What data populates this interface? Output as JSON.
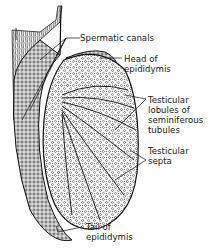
{
  "diagram": {
    "labels": [
      {
        "id": "spermatic-canals",
        "text": "Spermatic canals"
      },
      {
        "id": "head-of-epididymis",
        "text": "Head of\nepididymis"
      },
      {
        "id": "testicular-lobules",
        "text": "Testicular\nlobules of\nseminiferous\ntubules"
      },
      {
        "id": "testicular-septa",
        "text": "Testicular\nsepta"
      },
      {
        "id": "tail-of-epididymis",
        "text": "Tail of\nepididymis"
      }
    ]
  }
}
